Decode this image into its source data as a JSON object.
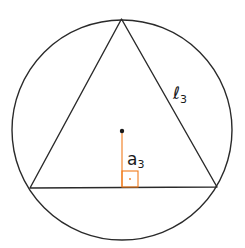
{
  "diagram": {
    "colors": {
      "stroke": "#2a2a2a",
      "apothem": "#f07a1a",
      "background": "#ffffff"
    },
    "labels": {
      "side": "ℓ",
      "side_sub": "3",
      "apothem": "a",
      "apothem_sub": "3"
    }
  }
}
